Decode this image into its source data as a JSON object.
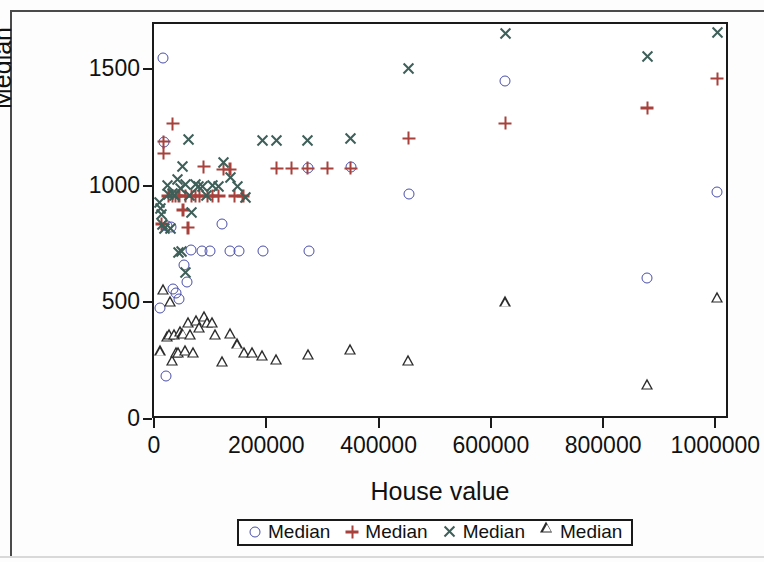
{
  "chart_data": {
    "type": "scatter",
    "title": "",
    "xlabel": "House value",
    "ylabel": "Median",
    "xlim": [
      0,
      1010000
    ],
    "ylim": [
      0,
      1700
    ],
    "grid": false,
    "legend_position": "bottom",
    "x_ticks": [
      "0",
      "200000",
      "400000",
      "600000",
      "800000",
      "1000000"
    ],
    "x_tick_values": [
      0,
      200000,
      400000,
      600000,
      800000,
      1000000
    ],
    "y_ticks": [
      "0",
      "500",
      "1000",
      "1500"
    ],
    "y_tick_values": [
      0,
      500,
      1000,
      1500
    ],
    "series": [
      {
        "name": "Median",
        "marker": "circle",
        "color": "#4a4fa8",
        "points": [
          [
            12000,
            1553
          ],
          [
            8000,
            480
          ],
          [
            14000,
            1193
          ],
          [
            20000,
            830
          ],
          [
            26000,
            828
          ],
          [
            18000,
            188
          ],
          [
            30000,
            560
          ],
          [
            35000,
            545
          ],
          [
            41000,
            518
          ],
          [
            50000,
            666
          ],
          [
            55000,
            592
          ],
          [
            63000,
            727
          ],
          [
            82000,
            724
          ],
          [
            97000,
            723
          ],
          [
            118000,
            840
          ],
          [
            131000,
            723
          ],
          [
            148000,
            723
          ],
          [
            190000,
            723
          ],
          [
            270000,
            1078
          ],
          [
            272000,
            723
          ],
          [
            347000,
            1085
          ],
          [
            450000,
            970
          ],
          [
            622000,
            1452
          ],
          [
            875000,
            610
          ],
          [
            1000000,
            978
          ]
        ]
      },
      {
        "name": "Median",
        "marker": "plus",
        "color": "#a8413c",
        "points": [
          [
            10000,
            840
          ],
          [
            14000,
            1193
          ],
          [
            14000,
            1143
          ],
          [
            22000,
            960
          ],
          [
            30000,
            1270
          ],
          [
            30000,
            960
          ],
          [
            35000,
            960
          ],
          [
            41000,
            960
          ],
          [
            48000,
            900
          ],
          [
            52000,
            960
          ],
          [
            57000,
            825
          ],
          [
            63000,
            960
          ],
          [
            70000,
            960
          ],
          [
            78000,
            960
          ],
          [
            85000,
            1085
          ],
          [
            92000,
            960
          ],
          [
            100000,
            960
          ],
          [
            112000,
            960
          ],
          [
            120000,
            1075
          ],
          [
            132000,
            1075
          ],
          [
            140000,
            960
          ],
          [
            155000,
            960
          ],
          [
            215000,
            1078
          ],
          [
            242000,
            1078
          ],
          [
            270000,
            1078
          ],
          [
            305000,
            1078
          ],
          [
            347000,
            1078
          ],
          [
            450000,
            1208
          ],
          [
            622000,
            1272
          ],
          [
            875000,
            1337
          ],
          [
            1000000,
            1462
          ]
        ]
      },
      {
        "name": "Median",
        "marker": "ex",
        "color": "#3e5f58",
        "points": [
          [
            6000,
            930
          ],
          [
            8000,
            905
          ],
          [
            10000,
            880
          ],
          [
            12000,
            838
          ],
          [
            16000,
            822
          ],
          [
            20000,
            1005
          ],
          [
            22000,
            968
          ],
          [
            26000,
            822
          ],
          [
            30000,
            972
          ],
          [
            33000,
            960
          ],
          [
            38000,
            1030
          ],
          [
            44000,
            990
          ],
          [
            48000,
            1085
          ],
          [
            52000,
            1010
          ],
          [
            58000,
            1200
          ],
          [
            60000,
            960
          ],
          [
            64000,
            890
          ],
          [
            70000,
            1010
          ],
          [
            75000,
            1000
          ],
          [
            82000,
            1000
          ],
          [
            90000,
            960
          ],
          [
            100000,
            1005
          ],
          [
            112000,
            1000
          ],
          [
            120000,
            1105
          ],
          [
            132000,
            1040
          ],
          [
            145000,
            1000
          ],
          [
            160000,
            952
          ],
          [
            190000,
            1198
          ],
          [
            215000,
            1198
          ],
          [
            270000,
            1198
          ],
          [
            347000,
            1205
          ],
          [
            450000,
            1508
          ],
          [
            622000,
            1655
          ],
          [
            875000,
            1558
          ],
          [
            1000000,
            1660
          ],
          [
            40000,
            718
          ],
          [
            46000,
            722
          ],
          [
            53000,
            632
          ]
        ]
      },
      {
        "name": "Median",
        "marker": "triangle",
        "color": "#2b2b2b",
        "points": [
          [
            8000,
            298
          ],
          [
            14000,
            563
          ],
          [
            20000,
            360
          ],
          [
            24000,
            370
          ],
          [
            26000,
            512
          ],
          [
            30000,
            258
          ],
          [
            33000,
            368
          ],
          [
            36000,
            290
          ],
          [
            40000,
            292
          ],
          [
            44000,
            380
          ],
          [
            48000,
            372
          ],
          [
            52000,
            300
          ],
          [
            58000,
            420
          ],
          [
            62000,
            370
          ],
          [
            66000,
            290
          ],
          [
            72000,
            430
          ],
          [
            78000,
            400
          ],
          [
            86000,
            445
          ],
          [
            92000,
            420
          ],
          [
            100000,
            420
          ],
          [
            106000,
            370
          ],
          [
            118000,
            255
          ],
          [
            132000,
            372
          ],
          [
            145000,
            328
          ],
          [
            158000,
            292
          ],
          [
            172000,
            290
          ],
          [
            190000,
            280
          ],
          [
            215000,
            262
          ],
          [
            272000,
            285
          ],
          [
            347000,
            305
          ],
          [
            450000,
            258
          ],
          [
            622000,
            508
          ],
          [
            875000,
            153
          ],
          [
            1000000,
            528
          ]
        ]
      }
    ]
  },
  "axes": {
    "y_title": "Median",
    "x_title": "House value"
  },
  "legend": {
    "entries": [
      {
        "label": "Median",
        "marker": "circle",
        "color": "#4a4fa8"
      },
      {
        "label": "Median",
        "marker": "plus",
        "color": "#a8413c"
      },
      {
        "label": "Median",
        "marker": "ex",
        "color": "#3e5f58"
      },
      {
        "label": "Median",
        "marker": "triangle",
        "color": "#2b2b2b"
      }
    ]
  }
}
